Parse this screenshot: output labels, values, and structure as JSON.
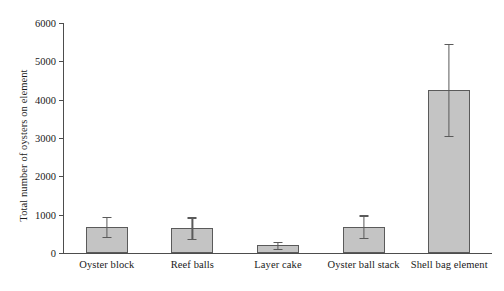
{
  "chart_data": {
    "type": "bar",
    "title": "",
    "xlabel": "",
    "ylabel": "Total number of oysters on element",
    "categories": [
      "Oyster block",
      "Reef balls",
      "Layer cake",
      "Oyster ball stack",
      "Shell bag element"
    ],
    "values": [
      680,
      650,
      200,
      690,
      4250
    ],
    "errors": [
      270,
      280,
      90,
      290,
      1200
    ],
    "ylim": [
      0,
      6000
    ],
    "yticks": [
      0,
      1000,
      2000,
      3000,
      4000,
      5000,
      6000
    ],
    "ytick_labels": [
      "0",
      "1000",
      "2000",
      "3000",
      "4000",
      "5000",
      "6000"
    ],
    "grid": false,
    "legend": null,
    "bar_color": "#c4c4c4",
    "bar_edge_color": "#5a5a5a",
    "axis_color": "#4d4d4d",
    "error_bar_color": "#5a5a5a",
    "error_bar_type": "symmetric",
    "bars": [
      {
        "category": "Oyster block",
        "value": 680,
        "error": 270,
        "err_low": 410,
        "err_high": 950
      },
      {
        "category": "Reef balls",
        "value": 650,
        "error": 280,
        "err_low": 370,
        "err_high": 930
      },
      {
        "category": "Layer cake",
        "value": 200,
        "error": 90,
        "err_low": 110,
        "err_high": 290
      },
      {
        "category": "Oyster ball stack",
        "value": 690,
        "error": 290,
        "err_low": 400,
        "err_high": 980
      },
      {
        "category": "Shell bag element",
        "value": 4250,
        "error": 1200,
        "err_low": 3050,
        "err_high": 5450
      }
    ]
  }
}
